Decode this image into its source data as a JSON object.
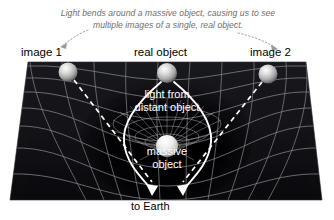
{
  "figure": {
    "caption": "Light bends around a massive object, causing us to see multiple images of a single, real object.",
    "labels": {
      "image1": "image 1",
      "real_object": "real object",
      "image2": "image 2",
      "light_from_distant": "light from\ndistant object",
      "light_from_line1": "light from",
      "light_from_line2": "distant object",
      "massive_line1": "massive",
      "massive_line2": "object",
      "to_earth": "to Earth"
    },
    "colors": {
      "page_background": "#ffffff",
      "spacetime_fill": "#15151a",
      "spacetime_fill_dark": "#0a0a0c",
      "grid_line": "#9a9a9a",
      "light_ray": "#ffffff",
      "caption_text": "#6e6e6e",
      "label_text": "#000000",
      "inner_label_text": "#ffffff",
      "sphere_highlight": "#f2f2f2",
      "sphere_mid": "#b8b8b8",
      "sphere_shadow": "#6a6a6a"
    },
    "elements": {
      "spheres": [
        {
          "name": "image-1-sphere",
          "cx": 68,
          "cy": 72,
          "r": 9.5
        },
        {
          "name": "real-object-sphere",
          "cx": 167,
          "cy": 73,
          "r": 10
        },
        {
          "name": "image-2-sphere",
          "cx": 268,
          "cy": 74,
          "r": 9.5
        },
        {
          "name": "massive-object-sphere",
          "cx": 167,
          "cy": 146,
          "r": 11
        }
      ],
      "arrows_to_earth": 2,
      "leader_lines": 2,
      "dashed_rays": 2,
      "curved_rays": 2
    }
  }
}
